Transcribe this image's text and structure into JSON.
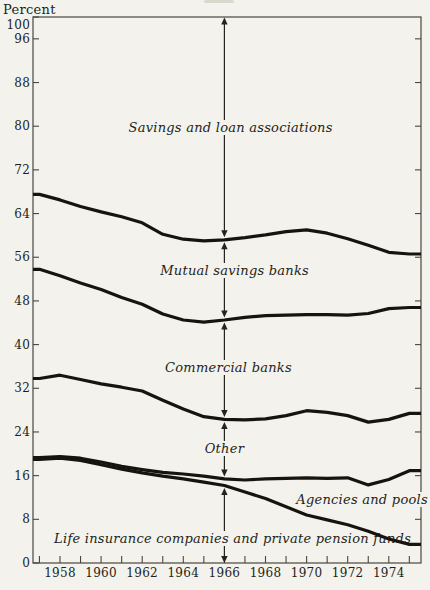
{
  "page": {
    "background": "#f4f2ec",
    "ink": "#17140f",
    "frame_color": "#4a463f",
    "annotation_color": "#26231e"
  },
  "chart_data": {
    "type": "line",
    "title": "",
    "ylabel": "Percent",
    "ylim": [
      0,
      100
    ],
    "yticks": [
      100,
      96,
      88,
      80,
      72,
      64,
      56,
      48,
      40,
      32,
      24,
      16,
      8,
      0
    ],
    "x_years": [
      1957,
      1958,
      1959,
      1960,
      1961,
      1962,
      1963,
      1964,
      1965,
      1966,
      1967,
      1968,
      1969,
      1970,
      1971,
      1972,
      1973,
      1974,
      1975
    ],
    "x_label_years": [
      1958,
      1960,
      1962,
      1964,
      1966,
      1968,
      1970,
      1972,
      1974
    ],
    "annotation_line_year": 1966,
    "grid": false,
    "note": "Cumulative percentage shares; curves are boundaries between stacked bands read top to bottom.",
    "series": [
      {
        "id": "boundary-below-savings-loans",
        "name": "Boundary under Savings and loan associations band",
        "values": [
          67.5,
          66.5,
          65.3,
          64.3,
          63.4,
          62.3,
          60.2,
          59.3,
          59.0,
          59.2,
          59.6,
          60.1,
          60.7,
          61.0,
          60.4,
          59.4,
          58.2,
          56.9,
          56.6
        ]
      },
      {
        "id": "boundary-below-mutual-savings",
        "name": "Boundary under Mutual savings banks band",
        "values": [
          53.8,
          52.6,
          51.3,
          50.1,
          48.6,
          47.4,
          45.6,
          44.5,
          44.1,
          44.5,
          45.0,
          45.3,
          45.4,
          45.5,
          45.5,
          45.4,
          45.7,
          46.6,
          46.8
        ]
      },
      {
        "id": "boundary-below-commercial-banks",
        "name": "Boundary under Commercial banks band",
        "values": [
          33.8,
          34.4,
          33.6,
          32.8,
          32.2,
          31.5,
          29.8,
          28.2,
          26.8,
          26.3,
          26.2,
          26.4,
          27.0,
          27.9,
          27.6,
          27.0,
          25.8,
          26.3,
          27.4
        ]
      },
      {
        "id": "boundary-below-other",
        "name": "Boundary under Other band",
        "values": [
          19.3,
          19.5,
          19.2,
          18.5,
          17.7,
          17.1,
          16.6,
          16.3,
          15.9,
          15.4,
          15.2,
          15.4,
          15.5,
          15.6,
          15.5,
          15.6,
          14.3,
          15.3,
          16.9
        ]
      },
      {
        "id": "boundary-below-agencies-pools",
        "name": "Boundary under Agencies and pools band",
        "values": [
          19.0,
          19.2,
          18.8,
          18.0,
          17.2,
          16.5,
          15.9,
          15.4,
          14.8,
          14.2,
          13.0,
          11.8,
          10.3,
          8.8,
          7.9,
          7.0,
          5.8,
          4.4,
          3.4
        ]
      }
    ],
    "bands": [
      {
        "label": "Savings and loan associations",
        "anchor": {
          "year": 1966.3,
          "pct": 79.7
        }
      },
      {
        "label": "Mutual savings banks",
        "anchor": {
          "year": 1966.5,
          "pct": 53.5
        }
      },
      {
        "label": "Commercial banks",
        "anchor": {
          "year": 1966.2,
          "pct": 35.7
        }
      },
      {
        "label": "Other",
        "anchor": {
          "year": 1966.0,
          "pct": 20.9
        }
      },
      {
        "label": "Agencies and pools",
        "anchor": {
          "year": 1972.7,
          "pct": 11.5
        }
      },
      {
        "label": "Life insurance companies and private pension funds",
        "anchor": {
          "year": 1966.4,
          "pct": 4.4
        }
      }
    ]
  }
}
